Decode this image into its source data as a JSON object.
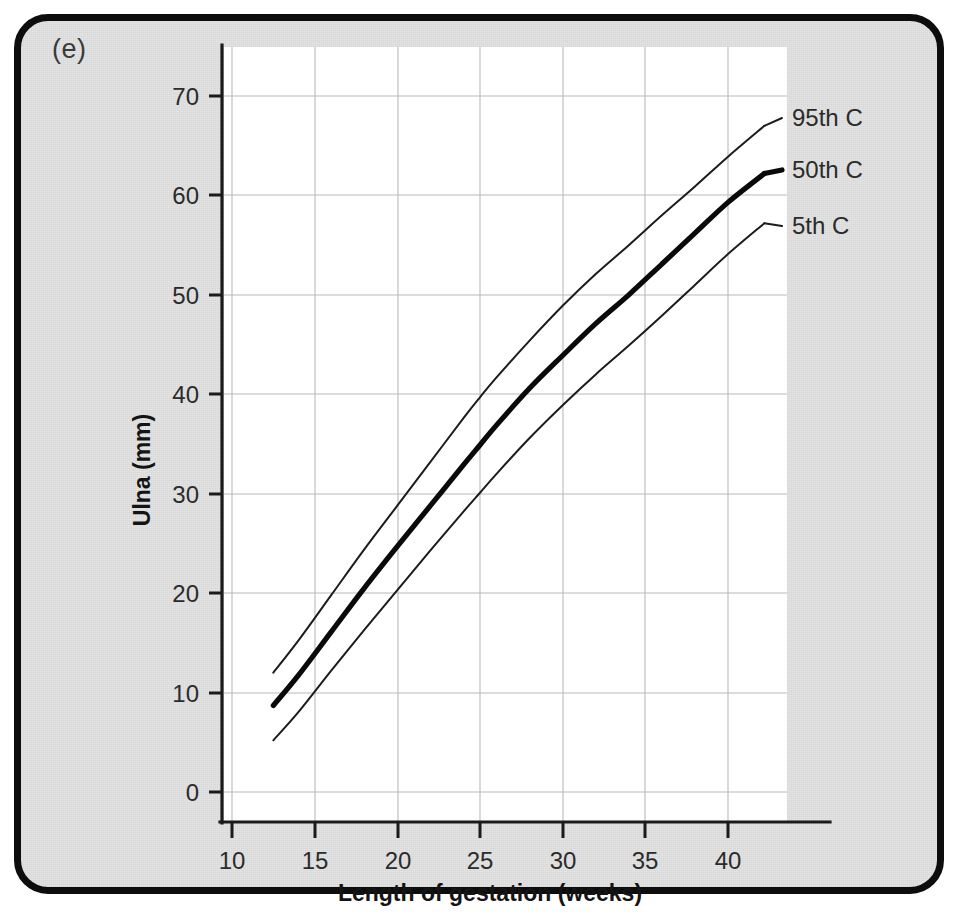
{
  "figure": {
    "panel_letter": "(e)",
    "background_color": "#e3e3e3",
    "border_color": "#0d0d0d",
    "plot_background_color": "#ffffff",
    "grid_color": "#b9b9b9"
  },
  "chart_data": {
    "type": "line",
    "title": "",
    "subtitle": "",
    "xlabel": "Length of gestation (weeks)",
    "ylabel": "Ulna (mm)",
    "xlim": [
      8.5,
      45
    ],
    "ylim": [
      -3.5,
      74
    ],
    "xticks": [
      10,
      15,
      20,
      25,
      30,
      35,
      40
    ],
    "xtick_labels": [
      "10",
      "15",
      "20",
      "25",
      "30",
      "35",
      "40"
    ],
    "yticks": [
      0,
      10,
      20,
      30,
      40,
      50,
      60,
      70
    ],
    "ytick_labels": [
      "0",
      "10",
      "20",
      "30",
      "40",
      "50",
      "60",
      "70"
    ],
    "grid": true,
    "legend_position": "right-inline-labels",
    "x": [
      12.5,
      14,
      16,
      18,
      20,
      22,
      24,
      25,
      26,
      28,
      30,
      32,
      34,
      36,
      38,
      40,
      42.2
    ],
    "series": [
      {
        "name": "95th C",
        "label": "95th C",
        "line_weight": "thin",
        "values": [
          12.0,
          15.2,
          19.8,
          24.4,
          28.8,
          33.2,
          37.6,
          39.7,
          41.7,
          45.4,
          48.9,
          52.1,
          55.0,
          58.0,
          60.9,
          63.9,
          67.0
        ]
      },
      {
        "name": "50th C",
        "label": "50th C",
        "line_weight": "thick",
        "values": [
          8.7,
          11.7,
          16.1,
          20.5,
          24.7,
          28.8,
          32.9,
          34.9,
          36.9,
          40.6,
          43.9,
          47.1,
          50.0,
          53.1,
          56.2,
          59.3,
          62.2
        ]
      },
      {
        "name": "5th C",
        "label": "5th C",
        "line_weight": "thin",
        "values": [
          5.2,
          8.0,
          12.2,
          16.3,
          20.3,
          24.3,
          28.2,
          30.1,
          32.0,
          35.6,
          38.9,
          42.0,
          44.9,
          47.9,
          51.0,
          54.1,
          57.2
        ]
      }
    ],
    "series_label_positions": [
      {
        "name": "95th C",
        "x_px": 792,
        "y_px": 126
      },
      {
        "name": "50th C",
        "x_px": 792,
        "y_px": 178
      },
      {
        "name": "5th C",
        "x_px": 792,
        "y_px": 234
      }
    ]
  }
}
